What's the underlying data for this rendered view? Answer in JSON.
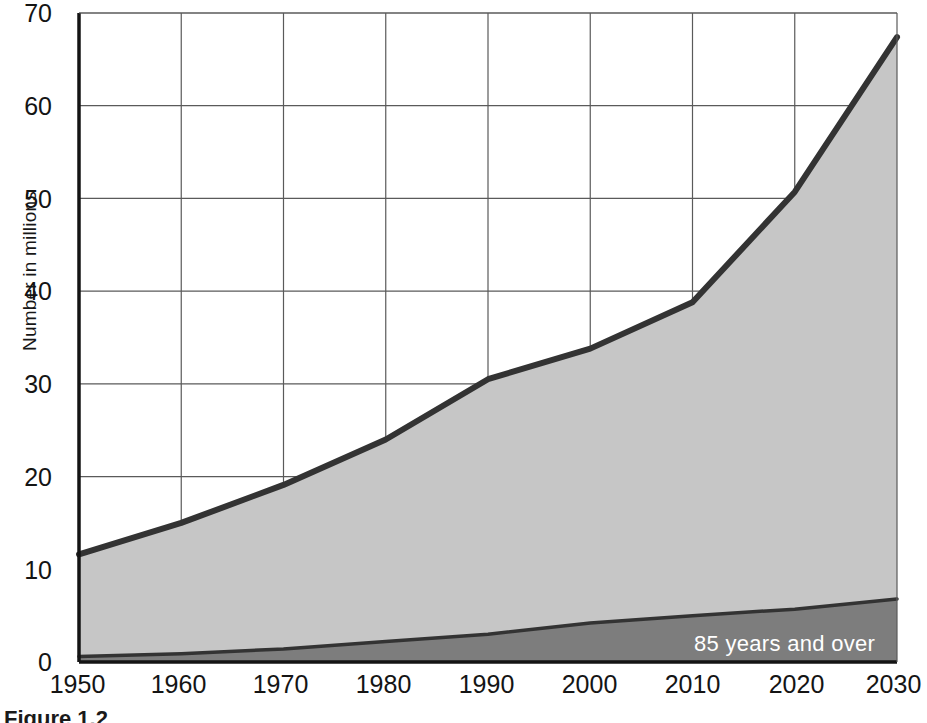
{
  "figure": {
    "caption": "Figure 1.2"
  },
  "axes": {
    "ylabel": "Number in millions",
    "yticks": [
      "0",
      "10",
      "20",
      "30",
      "40",
      "50",
      "60",
      "70"
    ],
    "xticks": [
      "1950",
      "1960",
      "1970",
      "1980",
      "1990",
      "2000",
      "2010",
      "2020",
      "2030"
    ]
  },
  "legend": {
    "dark_band_label": "85 years and over"
  },
  "colors": {
    "total_fill": "#c6c6c6",
    "band_fill": "#7d7d7d",
    "outline": "#333333",
    "gridline": "#5a5a5a",
    "axis": "#141414",
    "legend_text": "#ffffff"
  },
  "chart_data": {
    "type": "area",
    "title": "",
    "subtitle": "",
    "xlabel": "",
    "ylabel": "Number in millions",
    "xlim": [
      1950,
      2030
    ],
    "ylim": [
      0,
      70
    ],
    "grid": true,
    "legend_position": "inline-on-band",
    "x": [
      1950,
      1960,
      1970,
      1980,
      1990,
      2000,
      2010,
      2020,
      2030
    ],
    "xtick_labels": [
      "1950",
      "1960",
      "1970",
      "1980",
      "1990",
      "2000",
      "2010",
      "2020",
      "2030"
    ],
    "ytick_values": [
      0,
      10,
      20,
      30,
      40,
      50,
      60,
      70
    ],
    "ytick_labels": [
      "0",
      "10",
      "20",
      "30",
      "40",
      "50",
      "60",
      "70"
    ],
    "stacked": true,
    "series": [
      {
        "name": "85 years and over",
        "fill": "#7d7d7d",
        "values": [
          0.6,
          0.9,
          1.4,
          2.2,
          3.0,
          4.2,
          5.0,
          5.7,
          6.8
        ]
      },
      {
        "name": "65 years and over (total)",
        "fill": "#c6c6c6",
        "cumulative": true,
        "values": [
          11.6,
          15.0,
          19.1,
          24.0,
          30.5,
          33.8,
          38.8,
          50.7,
          67.4
        ]
      }
    ],
    "annotations": [
      {
        "text": "85 years and over",
        "x": 2016,
        "y": 3.0,
        "color": "#ffffff"
      }
    ]
  }
}
